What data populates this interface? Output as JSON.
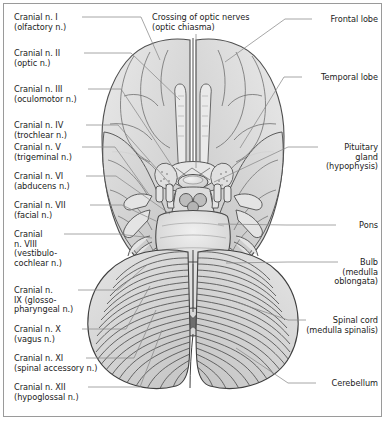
{
  "figure": {
    "border_color": "#9a9a9a",
    "leader_color": "#8a8a8a",
    "text_color": "#1c1c1c",
    "background": "#ffffff"
  },
  "labels_left": [
    {
      "id": "cn-1",
      "lines": [
        "Cranial n. I",
        "(olfactory n.)"
      ],
      "x": 14,
      "y": 13,
      "leader": [
        [
          82,
          17
        ],
        [
          141,
          17
        ],
        [
          160,
          60
        ]
      ]
    },
    {
      "id": "cn-2",
      "lines": [
        "Cranial n. II",
        "(optic n.)"
      ],
      "x": 14,
      "y": 49,
      "leader": [
        [
          84,
          53
        ],
        [
          131,
          53
        ],
        [
          180,
          100
        ]
      ]
    },
    {
      "id": "cn-3",
      "lines": [
        "Cranial n. III",
        "(oculomotor n.)"
      ],
      "x": 14,
      "y": 85,
      "leader": [
        [
          88,
          89
        ],
        [
          121,
          89
        ],
        [
          176,
          172
        ]
      ]
    },
    {
      "id": "cn-4",
      "lines": [
        "Cranial n. IV",
        "(trochlear n.)"
      ],
      "x": 14,
      "y": 121,
      "leader": [
        [
          86,
          125
        ],
        [
          118,
          125
        ],
        [
          172,
          186
        ]
      ]
    },
    {
      "id": "cn-5",
      "lines": [
        "Cranial n. V",
        "(trigeminal n.)"
      ],
      "x": 14,
      "y": 143,
      "leader": [
        [
          82,
          147
        ],
        [
          115,
          147
        ],
        [
          150,
          196
        ]
      ]
    },
    {
      "id": "cn-6",
      "lines": [
        "Cranial n. VI",
        "(abducens n.)"
      ],
      "x": 14,
      "y": 172,
      "leader": [
        [
          86,
          176
        ],
        [
          116,
          176
        ],
        [
          170,
          214
        ]
      ]
    },
    {
      "id": "cn-7",
      "lines": [
        "Cranial n. VII",
        "(facial n.)"
      ],
      "x": 14,
      "y": 201,
      "leader": [
        [
          90,
          205
        ],
        [
          122,
          205
        ],
        [
          158,
          222
        ]
      ]
    },
    {
      "id": "cn-8",
      "lines": [
        "Cranial",
        "n. VIII",
        "(vestibulo-",
        "cochlear n.)"
      ],
      "x": 14,
      "y": 230,
      "leader": [
        [
          64,
          234
        ],
        [
          118,
          234
        ],
        [
          152,
          238
        ]
      ]
    },
    {
      "id": "cn-9",
      "lines": [
        "Cranial n.",
        "IX (glosso-",
        "pharyngeal n.)"
      ],
      "x": 14,
      "y": 286,
      "leader": [
        [
          78,
          290
        ],
        [
          118,
          290
        ],
        [
          148,
          264
        ]
      ]
    },
    {
      "id": "cn-10",
      "lines": [
        "Cranial n. X",
        "(vagus n.)"
      ],
      "x": 14,
      "y": 325,
      "leader": [
        [
          82,
          329
        ],
        [
          126,
          329
        ],
        [
          150,
          286
        ]
      ]
    },
    {
      "id": "cn-11",
      "lines": [
        "Cranial n. XI",
        "(spinal accessory n.)"
      ],
      "x": 14,
      "y": 354,
      "leader": [
        [
          86,
          358
        ],
        [
          134,
          358
        ],
        [
          156,
          310
        ]
      ]
    },
    {
      "id": "cn-12",
      "lines": [
        "Cranial n. XII",
        "(hypoglossal n.)"
      ],
      "x": 14,
      "y": 383,
      "leader": [
        [
          88,
          387
        ],
        [
          140,
          387
        ],
        [
          162,
          330
        ]
      ]
    }
  ],
  "labels_right": [
    {
      "id": "frontal-lobe",
      "lines": [
        "Frontal lobe"
      ],
      "right": 8,
      "y": 15,
      "leader": [
        [
          312,
          19
        ],
        [
          285,
          19
        ],
        [
          225,
          62
        ]
      ]
    },
    {
      "id": "temporal-lobe",
      "lines": [
        "Temporal lobe"
      ],
      "right": 8,
      "y": 73,
      "leader": [
        [
          302,
          77
        ],
        [
          284,
          77
        ],
        [
          240,
          148
        ]
      ]
    },
    {
      "id": "pituitary",
      "lines": [
        "Pituitary",
        "gland",
        "(hypophysis)"
      ],
      "right": 8,
      "y": 143,
      "leader": [
        [
          318,
          147
        ],
        [
          288,
          147
        ],
        [
          214,
          182
        ]
      ]
    },
    {
      "id": "pons",
      "lines": [
        "Pons"
      ],
      "right": 8,
      "y": 221,
      "leader": [
        [
          336,
          225
        ],
        [
          286,
          225
        ],
        [
          218,
          224
        ]
      ]
    },
    {
      "id": "bulb",
      "lines": [
        "Bulb",
        "(medulla",
        "oblongata)"
      ],
      "right": 8,
      "y": 258,
      "leader": [
        [
          338,
          262
        ],
        [
          288,
          262
        ],
        [
          226,
          263
        ]
      ]
    },
    {
      "id": "spinal-cord",
      "lines": [
        "Spinal cord",
        "(medulla spinalis)"
      ],
      "right": 8,
      "y": 316,
      "leader": [
        [
          306,
          320
        ],
        [
          288,
          320
        ],
        [
          236,
          302
        ]
      ]
    },
    {
      "id": "cerebellum",
      "lines": [
        "Cerebellum"
      ],
      "right": 8,
      "y": 379,
      "leader": [
        [
          316,
          383
        ],
        [
          288,
          383
        ],
        [
          236,
          348
        ]
      ]
    }
  ],
  "labels_top": [
    {
      "id": "optic-chiasma",
      "lines": [
        "Crossing of optic nerves",
        "(optic chiasma)"
      ],
      "x": 152,
      "y": 13,
      "leader": [
        [
          196,
          34
        ],
        [
          196,
          168
        ]
      ]
    }
  ],
  "anatomy": {
    "frontal_lobe": "frontal-lobe-region",
    "temporal_lobe": "temporal-lobe-region",
    "olfactory_tract": "olfactory-tract",
    "optic_chiasm": "optic-chiasm",
    "pituitary_gland": "pituitary-gland",
    "mammillary_bodies": "mammillary-bodies",
    "pons": "pons-region",
    "medulla_oblongata": "medulla-oblongata",
    "cerebellum": "cerebellum-region",
    "spinal_cord": "spinal-cord-cross-section"
  },
  "palette": {
    "cortex_light": "#e3e3e3",
    "cortex_mid": "#d2d2d2",
    "cortex_dark": "#bdbdbd",
    "stem_light": "#e8e8e8",
    "stem_mid": "#d6d6d6",
    "cerebellum_base": "#dcdcdc",
    "outline": "#4a4a4a",
    "outline_soft": "#7d7d7d",
    "hatch": "#565656"
  }
}
